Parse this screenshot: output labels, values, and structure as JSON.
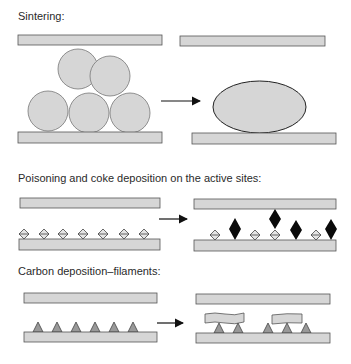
{
  "sections": [
    {
      "id": "sintering",
      "title": "Sintering:"
    },
    {
      "id": "poisoning",
      "title": "Poisoning and coke deposition on the active sites:"
    },
    {
      "id": "carbon",
      "title": "Carbon deposition–filaments:"
    }
  ],
  "colors": {
    "fill": "#d6d6d6",
    "stroke": "#555555",
    "coke": "#0a0a0a",
    "triangle": "#9a9a9a",
    "arrow": "#111111"
  }
}
